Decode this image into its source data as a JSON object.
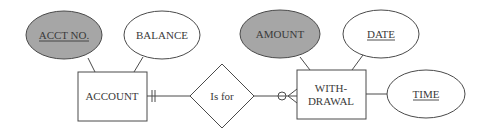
{
  "diagram": {
    "type": "entity-relationship",
    "entities": [
      {
        "id": "account",
        "label": "ACCOUNT"
      },
      {
        "id": "withdrawal",
        "label_line1": "WITH-",
        "label_line2": "DRAWAL"
      }
    ],
    "relationship": {
      "id": "is_for",
      "label": "Is for"
    },
    "attributes": [
      {
        "id": "acct_no",
        "label": "ACCT NO.",
        "entity": "account",
        "underlined": true,
        "shaded": true
      },
      {
        "id": "balance",
        "label": "BALANCE",
        "entity": "account",
        "underlined": false,
        "shaded": false
      },
      {
        "id": "amount",
        "label": "AMOUNT",
        "entity": "withdrawal",
        "underlined": false,
        "shaded": true
      },
      {
        "id": "date",
        "label": "DATE",
        "entity": "withdrawal",
        "underlined": true,
        "shaded": false
      },
      {
        "id": "time",
        "label": "TIME",
        "entity": "withdrawal",
        "underlined": true,
        "shaded": false
      }
    ],
    "cardinality": {
      "account_side": "one-and-only-one",
      "withdrawal_side": "zero-or-many"
    },
    "colors": {
      "line": "#4a4a4a",
      "shaded_fill": "#a6a6a6",
      "background": "#ffffff"
    }
  }
}
